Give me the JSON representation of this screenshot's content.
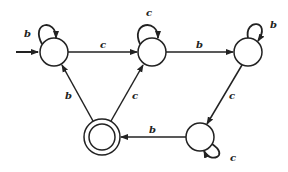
{
  "diagram": {
    "type": "finite-automaton",
    "states": [
      {
        "id": "q0",
        "initial": true,
        "accepting": false,
        "self_loop": "b"
      },
      {
        "id": "q1",
        "initial": false,
        "accepting": false,
        "self_loop": "c"
      },
      {
        "id": "q2",
        "initial": false,
        "accepting": false,
        "self_loop": "b"
      },
      {
        "id": "q3",
        "initial": false,
        "accepting": false,
        "self_loop": "c"
      },
      {
        "id": "q4",
        "initial": false,
        "accepting": true,
        "self_loop": null
      }
    ],
    "transitions": [
      {
        "from": "q0",
        "to": "q1",
        "label": "c"
      },
      {
        "from": "q1",
        "to": "q2",
        "label": "b"
      },
      {
        "from": "q2",
        "to": "q3",
        "label": "c"
      },
      {
        "from": "q3",
        "to": "q4",
        "label": "b"
      },
      {
        "from": "q4",
        "to": "q0",
        "label": "b"
      },
      {
        "from": "q4",
        "to": "q1",
        "label": "c"
      }
    ],
    "labels": {
      "loop_q0": "b",
      "loop_q1": "c",
      "loop_q2": "b",
      "loop_q3": "c",
      "q0_q1": "c",
      "q1_q2": "b",
      "q2_q3": "c",
      "q3_q4": "b",
      "q4_q0": "b",
      "q4_q1": "c"
    }
  }
}
